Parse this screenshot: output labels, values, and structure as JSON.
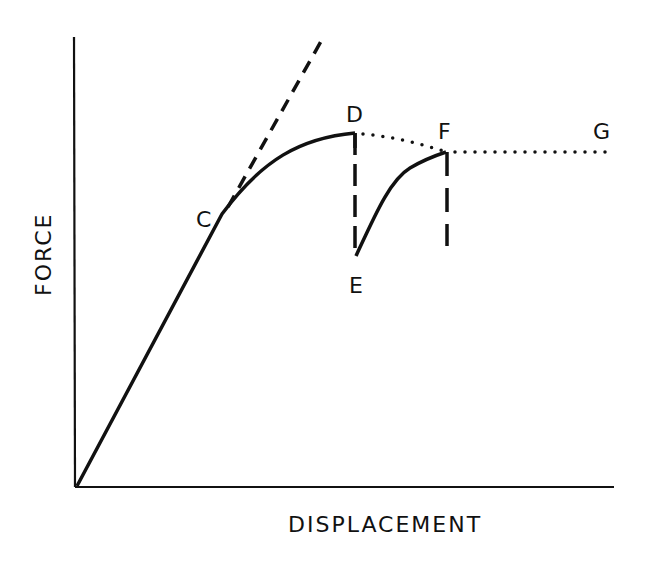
{
  "diagram": {
    "type": "force-displacement curve",
    "axes": {
      "x_label": "DISPLACEMENT",
      "y_label": "FORCE",
      "origin": [
        77,
        486
      ],
      "x_end": [
        614,
        486
      ],
      "y_end": [
        73,
        37
      ]
    },
    "points": {
      "C": {
        "label": "C",
        "pos": [
          228,
          205
        ],
        "label_pos": [
          204,
          226
        ]
      },
      "D": {
        "label": "D",
        "pos": [
          355,
          133
        ],
        "label_pos": [
          355,
          120
        ]
      },
      "E": {
        "label": "E",
        "pos": [
          356,
          256
        ],
        "label_pos": [
          357,
          292
        ]
      },
      "F": {
        "label": "F",
        "pos": [
          446,
          152
        ],
        "label_pos": [
          446,
          138
        ]
      },
      "G": {
        "label": "G",
        "pos": [
          610,
          152
        ],
        "label_pos": [
          601,
          138
        ]
      }
    },
    "segments": [
      {
        "name": "elastic-loading",
        "style": "solid",
        "from": "origin",
        "to": "C"
      },
      {
        "name": "plastic-hardening",
        "style": "solid",
        "from": "C",
        "to": "D"
      },
      {
        "name": "tangent-extension",
        "style": "dashed",
        "from": "C",
        "to": [
          323,
          37
        ]
      },
      {
        "name": "unload-drop",
        "style": "dashed",
        "from": "D",
        "to": "E"
      },
      {
        "name": "reload-curve",
        "style": "solid",
        "from": "E",
        "to": "F"
      },
      {
        "name": "envelope-decay",
        "style": "dotted",
        "from": "D",
        "to": "F"
      },
      {
        "name": "plateau",
        "style": "dotted",
        "from": "F",
        "to": "G"
      },
      {
        "name": "F-drop",
        "style": "dashed",
        "from": "F",
        "to": [
          447,
          245
        ]
      }
    ],
    "colors": {
      "ink": "#111111",
      "background": "#ffffff"
    }
  }
}
